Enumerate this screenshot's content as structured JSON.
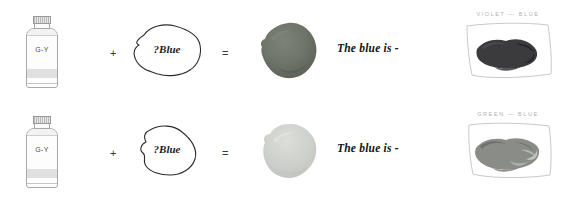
{
  "page": {
    "background_color": "#ffffff"
  },
  "symbols": {
    "plus": "+",
    "equals": "="
  },
  "rows": [
    {
      "id": "row-violet-blue",
      "tube": {
        "label": "G-Y",
        "cap_color": "#c8c8c8",
        "body_color": "#fdfdfd",
        "band_color": "#e0e0e0"
      },
      "unknown": {
        "label": "?Blue"
      },
      "result": {
        "name": "dark-mixed-splotch",
        "color": "#6f7469",
        "shade_color": "#5d6258",
        "highlight_color": "#7e8377"
      },
      "caption": "The blue is -",
      "swatch": {
        "title": "VIOLET — BLUE",
        "smear_color": "#3b3a3c",
        "smear_shade": "#222124",
        "smear_highlight": "#55545a",
        "frame_color": "#c9c9c9"
      }
    },
    {
      "id": "row-green-blue",
      "tube": {
        "label": "G-Y",
        "cap_color": "#c8c8c8",
        "body_color": "#fdfdfd",
        "band_color": "#e0e0e0"
      },
      "unknown": {
        "label": "?Blue"
      },
      "result": {
        "name": "light-mixed-splotch",
        "color": "#cfd2cc",
        "shade_color": "#c2c5bf",
        "highlight_color": "#dcdfd9"
      },
      "caption": "The blue is -",
      "swatch": {
        "title": "GREEN — BLUE",
        "smear_color": "#8a8c88",
        "smear_shade": "#6e706c",
        "smear_highlight": "#b6b8b3",
        "frame_color": "#c9c9c9"
      }
    }
  ]
}
